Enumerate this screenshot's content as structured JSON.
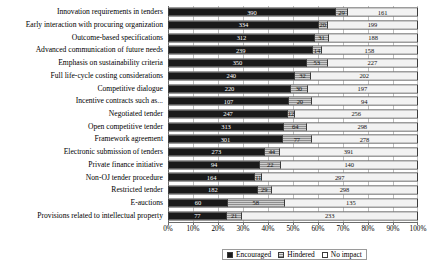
{
  "chart_data": {
    "type": "bar",
    "orientation": "horizontal",
    "stacked": true,
    "normalized": true,
    "title": "",
    "subtitle": "",
    "xlabel": "",
    "ylabel": "",
    "xlim": [
      0,
      100
    ],
    "xunit": "%",
    "grid": true,
    "legend_position": "bottom",
    "xticklabels": [
      "0%",
      "10%",
      "20%",
      "30%",
      "40%",
      "50%",
      "60%",
      "70%",
      "80%",
      "90%",
      "100%"
    ],
    "xtickvalues": [
      0,
      10,
      20,
      30,
      40,
      50,
      60,
      70,
      80,
      90,
      100
    ],
    "legend": [
      {
        "name": "Encouraged",
        "color": "#1a1a1a",
        "pattern": "solid-black"
      },
      {
        "name": "Hindered",
        "color": "#8e8e8e",
        "pattern": "horizontal-hatch"
      },
      {
        "name": "No impact",
        "color": "#f2f2f2",
        "pattern": "empty"
      }
    ],
    "categories": [
      "Innovation requirements in tenders",
      "Early interaction with procuring organization",
      "Outcome-based specifications",
      "Advanced communication of future needs",
      "Emphasis on sustainability criteria",
      "Full life-cycle costing considerations",
      "Competitive dialogue",
      "Incentive contracts such as...",
      "Negotiated tender",
      "Open competitive tender",
      "Framework agreement",
      "Electronic submission of tenders",
      "Private finance initiative",
      "Non-OJ tender procedure",
      "Restricted tender",
      "E-auctions",
      "Provisions related to intellectual property"
    ],
    "series": [
      {
        "name": "Encouraged",
        "values": [
          390,
          334,
          312,
          239,
          350,
          240,
          220,
          107,
          247,
          313,
          301,
          273,
          94,
          164,
          182,
          60,
          77
        ]
      },
      {
        "name": "Hindered",
        "values": [
          29,
          20,
          31,
          14,
          53,
          32,
          30,
          20,
          12,
          64,
          77,
          44,
          22,
          11,
          29,
          58,
          21
        ]
      },
      {
        "name": "No impact",
        "values": [
          161,
          199,
          188,
          158,
          227,
          202,
          197,
          94,
          256,
          298,
          278,
          391,
          140,
          297,
          298,
          135,
          233
        ]
      }
    ],
    "rows": [
      {
        "label": "Innovation requirements in tenders",
        "encouraged": 390,
        "hindered": 29,
        "no_impact": 161
      },
      {
        "label": "Early interaction with procuring organization",
        "encouraged": 334,
        "hindered": 20,
        "no_impact": 199
      },
      {
        "label": "Outcome-based specifications",
        "encouraged": 312,
        "hindered": 31,
        "no_impact": 188
      },
      {
        "label": "Advanced communication of future needs",
        "encouraged": 239,
        "hindered": 14,
        "no_impact": 158
      },
      {
        "label": "Emphasis on sustainability criteria",
        "encouraged": 350,
        "hindered": 53,
        "no_impact": 227
      },
      {
        "label": "Full life-cycle costing considerations",
        "encouraged": 240,
        "hindered": 32,
        "no_impact": 202
      },
      {
        "label": "Competitive dialogue",
        "encouraged": 220,
        "hindered": 30,
        "no_impact": 197
      },
      {
        "label": "Incentive contracts such as...",
        "encouraged": 107,
        "hindered": 20,
        "no_impact": 94
      },
      {
        "label": "Negotiated tender",
        "encouraged": 247,
        "hindered": 12,
        "no_impact": 256
      },
      {
        "label": "Open competitive tender",
        "encouraged": 313,
        "hindered": 64,
        "no_impact": 298
      },
      {
        "label": "Framework agreement",
        "encouraged": 301,
        "hindered": 77,
        "no_impact": 278
      },
      {
        "label": "Electronic submission of tenders",
        "encouraged": 273,
        "hindered": 44,
        "no_impact": 391
      },
      {
        "label": "Private finance initiative",
        "encouraged": 94,
        "hindered": 22,
        "no_impact": 140
      },
      {
        "label": "Non-OJ tender procedure",
        "encouraged": 164,
        "hindered": 11,
        "no_impact": 297
      },
      {
        "label": "Restricted tender",
        "encouraged": 182,
        "hindered": 29,
        "no_impact": 298
      },
      {
        "label": "E-auctions",
        "encouraged": 60,
        "hindered": 58,
        "no_impact": 135
      },
      {
        "label": "Provisions related to intellectual property",
        "encouraged": 77,
        "hindered": 21,
        "no_impact": 233
      }
    ]
  }
}
